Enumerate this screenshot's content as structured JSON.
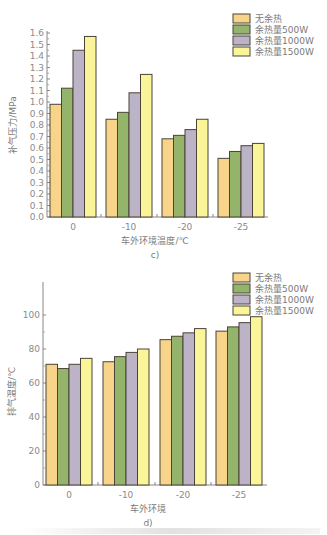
{
  "chart_data": [
    {
      "type": "bar",
      "panel": "c)",
      "title": "",
      "xlabel": "车外环境温度/℃",
      "ylabel": "补气压力/MPa",
      "categories": [
        "0",
        "-10",
        "-20",
        "-25"
      ],
      "ylim": [
        0.0,
        1.6
      ],
      "yticks": [
        "0.0",
        "0.1",
        "0.2",
        "0.3",
        "0.4",
        "0.5",
        "0.6",
        "0.7",
        "0.8",
        "0.9",
        "1.0",
        "1.1",
        "1.2",
        "1.3",
        "1.4",
        "1.5",
        "1.6"
      ],
      "grid": false,
      "legend_position": "top-right",
      "series": [
        {
          "name": "无余热",
          "color": "#f7d48a",
          "values": [
            0.98,
            0.85,
            0.68,
            0.51
          ]
        },
        {
          "name": "余热量500W",
          "color": "#93b46a",
          "values": [
            1.12,
            0.91,
            0.71,
            0.57
          ]
        },
        {
          "name": "余热量1000W",
          "color": "#bdb3c6",
          "values": [
            1.45,
            1.08,
            0.76,
            0.62
          ]
        },
        {
          "name": "余热量1500W",
          "color": "#fbf59a",
          "values": [
            1.57,
            1.24,
            0.85,
            0.64
          ]
        }
      ]
    },
    {
      "type": "bar",
      "panel": "d)",
      "title": "",
      "xlabel": "车外环境",
      "ylabel": "排气温度/℃",
      "categories": [
        "0",
        "-10",
        "-20",
        "-25"
      ],
      "ylim": [
        0,
        110
      ],
      "yticks": [
        "0",
        "20",
        "40",
        "60",
        "80",
        "100"
      ],
      "grid": false,
      "legend_position": "top-right",
      "series": [
        {
          "name": "无余热",
          "color": "#f7d48a",
          "values": [
            71,
            72.5,
            85.5,
            90.5
          ]
        },
        {
          "name": "余热量500W",
          "color": "#93b46a",
          "values": [
            68.5,
            75.5,
            87.5,
            93
          ]
        },
        {
          "name": "余热量1000W",
          "color": "#bdb3c6",
          "values": [
            71,
            78,
            89.5,
            95.5
          ]
        },
        {
          "name": "余热量1500W",
          "color": "#fbf59a",
          "values": [
            74.5,
            80,
            92,
            99
          ]
        }
      ]
    }
  ],
  "captions": {
    "c": "c)",
    "d": "d)"
  }
}
